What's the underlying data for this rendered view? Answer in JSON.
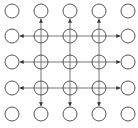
{
  "diagram": {
    "title": "",
    "grid": {
      "columns": 5,
      "rows": 5
    },
    "column_x": [
      12,
      41,
      70,
      99,
      128
    ],
    "row_y": [
      11,
      36,
      62,
      88,
      114
    ],
    "node_radius": 7,
    "colors": {
      "stroke": "#555555",
      "line": "#777777",
      "arrow": "#333333",
      "background": "#ffffff"
    },
    "node_types": {
      "plain": "circle",
      "crossed": "circle-with-plus"
    },
    "inner_nodes": "rows 1-3, columns 1-3 are crossed circles",
    "outer_nodes": "border ring of plain circles",
    "edges": {
      "horizontal_lines": "rows 1-3 span from column 0 to column 4, arrows pointing outward at both ends",
      "vertical_lines": "columns 1-3 span from row 0 to row 4, arrows pointing outward at both ends"
    }
  }
}
